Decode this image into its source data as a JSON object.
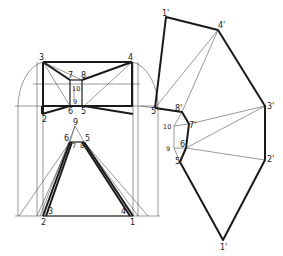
{
  "diagram": {
    "type": "sheet-metal transition piece development (triangulation)",
    "background": "#ffffff",
    "line_color": "#1a1a1a",
    "views": {
      "plan": {
        "labels": {
          "p3": "3",
          "p4": "4",
          "p7": "7",
          "p8": "8",
          "p10": "10",
          "p9": "9",
          "p2": "2",
          "p6": "6",
          "p5": "5"
        }
      },
      "elevation": {
        "labels": {
          "apex9": "9",
          "p6": "6",
          "p5": "5",
          "p7": "7",
          "p8": "8",
          "p10": "10",
          "p3": "3",
          "p4": "4",
          "p2": "2",
          "p1": "1"
        }
      },
      "development": {
        "labels": {
          "p1a": "1'",
          "p4": "4'",
          "p3": "3'",
          "p2": "2'",
          "p1b": "1'",
          "p5a": "5'",
          "p8": "8'",
          "p7": "7'",
          "p10": "10",
          "p9": "9",
          "p6": "6'",
          "p5b": "5'"
        }
      }
    }
  }
}
